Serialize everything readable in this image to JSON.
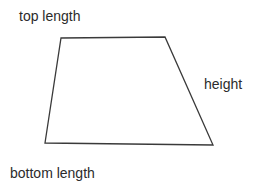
{
  "diagram": {
    "type": "trapezoid-labeled-diagram",
    "background_color": "#ffffff",
    "stroke_color": "#3a3a3a",
    "stroke_width": 1.3,
    "text_color": "#2b2b2b",
    "shape": {
      "name": "trapezoid",
      "fill": "none",
      "vertices": [
        {
          "name": "top-left",
          "x": 61,
          "y": 38
        },
        {
          "name": "top-right",
          "x": 165,
          "y": 37
        },
        {
          "name": "bottom-right",
          "x": 213,
          "y": 145
        },
        {
          "name": "bottom-left",
          "x": 45,
          "y": 143
        }
      ],
      "points_attr": "61,38 165,37 213,145 45,143"
    },
    "labels": {
      "top_length": "top length",
      "height": "height",
      "bottom_length": "bottom length"
    }
  }
}
